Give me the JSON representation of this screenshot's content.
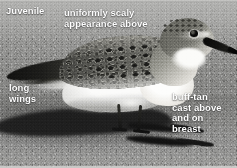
{
  "photo": {
    "subject": "juvenile sandpiper standing on sand",
    "rendering": "black-and-white field-guide photograph",
    "alt": "Juvenile sandpiper in profile on sand with long dark wingtips and a strong cast shadow"
  },
  "annotations": [
    {
      "id": "juvenile",
      "text": "Juvenile",
      "position": "top-left",
      "color": "#ffffff"
    },
    {
      "id": "scaly",
      "text": "uniformly scaly\nappearance above",
      "position": "top-center",
      "color": "#ffffff"
    },
    {
      "id": "long-wings",
      "text": "long\nwings",
      "position": "mid-left",
      "color": "#ffffff"
    },
    {
      "id": "buff-tan",
      "text": "buff-tan\ncast above\nand on\nbreast",
      "position": "bottom-right",
      "color": "#ffffff"
    }
  ],
  "bird_parts": {
    "bill": "long black slightly drooped bill",
    "eye": "large dark eye",
    "crown": "finely streaked grey-brown crown",
    "mantle": "scaly dark-centred pale-fringed upperparts",
    "wings": "long dark primaries projecting past tail",
    "underparts": "white belly and breast",
    "legs": "dark legs and feet"
  },
  "scene": {
    "substrate": "dry sand",
    "shadow": "strong dark cast shadow to the left"
  }
}
